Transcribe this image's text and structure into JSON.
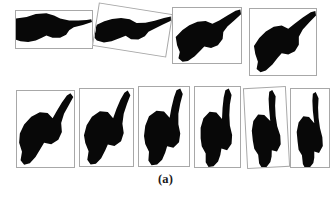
{
  "figure": {
    "caption": "(a)",
    "kind": "image-grid",
    "background_color": "#ffffff",
    "silhouette_color": "#080808",
    "panel_border_color": "#a8a8a8",
    "rows": 2,
    "panels": [
      {
        "index": 1,
        "row": 1,
        "label": "hand-silhouette-1",
        "rotation_deg": 0,
        "frame": {
          "x": 15,
          "y": 10,
          "w": 78,
          "h": 39
        },
        "frame_tilt_deg": 0,
        "shape_tilt_deg": 0,
        "pointing_direction": "right"
      },
      {
        "index": 2,
        "row": 1,
        "label": "hand-silhouette-2",
        "rotation_deg": 10,
        "frame": {
          "x": 95,
          "y": 8,
          "w": 75,
          "h": 44
        },
        "frame_tilt_deg": 9,
        "shape_tilt_deg": 10,
        "pointing_direction": "right"
      },
      {
        "index": 3,
        "row": 1,
        "label": "hand-silhouette-3",
        "rotation_deg": 20,
        "frame": {
          "x": 172,
          "y": 7,
          "w": 70,
          "h": 57
        },
        "frame_tilt_deg": 0,
        "shape_tilt_deg": 20,
        "pointing_direction": "up-right"
      },
      {
        "index": 4,
        "row": 1,
        "label": "hand-silhouette-4",
        "rotation_deg": 32,
        "frame": {
          "x": 249,
          "y": 8,
          "w": 68,
          "h": 68
        },
        "frame_tilt_deg": 0,
        "shape_tilt_deg": 32,
        "pointing_direction": "up-right"
      },
      {
        "index": 5,
        "row": 2,
        "label": "hand-silhouette-5",
        "rotation_deg": 45,
        "frame": {
          "x": 16,
          "y": 90,
          "w": 59,
          "h": 78
        },
        "frame_tilt_deg": 0,
        "shape_tilt_deg": 45,
        "pointing_direction": "up-right"
      },
      {
        "index": 6,
        "row": 2,
        "label": "hand-silhouette-6",
        "rotation_deg": 55,
        "frame": {
          "x": 79,
          "y": 88,
          "w": 55,
          "h": 79
        },
        "frame_tilt_deg": 0,
        "shape_tilt_deg": 55,
        "pointing_direction": "up-right"
      },
      {
        "index": 7,
        "row": 2,
        "label": "hand-silhouette-7",
        "rotation_deg": 65,
        "frame": {
          "x": 138,
          "y": 86,
          "w": 52,
          "h": 81
        },
        "frame_tilt_deg": 0,
        "shape_tilt_deg": 65,
        "pointing_direction": "up"
      },
      {
        "index": 8,
        "row": 2,
        "label": "hand-silhouette-8",
        "rotation_deg": 75,
        "frame": {
          "x": 194,
          "y": 86,
          "w": 47,
          "h": 82
        },
        "frame_tilt_deg": 0,
        "shape_tilt_deg": 75,
        "pointing_direction": "up"
      },
      {
        "index": 9,
        "row": 2,
        "label": "hand-silhouette-9",
        "rotation_deg": 85,
        "frame": {
          "x": 245,
          "y": 87,
          "w": 43,
          "h": 81
        },
        "frame_tilt_deg": -3,
        "shape_tilt_deg": 85,
        "pointing_direction": "up"
      },
      {
        "index": 10,
        "row": 2,
        "label": "hand-silhouette-10",
        "rotation_deg": 92,
        "frame": {
          "x": 290,
          "y": 88,
          "w": 40,
          "h": 80
        },
        "frame_tilt_deg": 0,
        "shape_tilt_deg": 92,
        "pointing_direction": "up"
      }
    ]
  }
}
